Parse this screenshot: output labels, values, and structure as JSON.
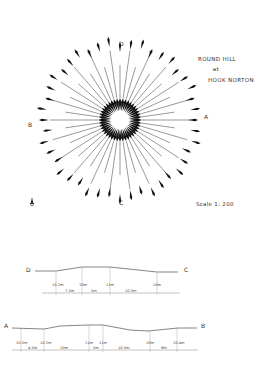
{
  "title": {
    "line1": "ROUND HILL",
    "line2": "at",
    "line3": "HOOK NORTON"
  },
  "plan": {
    "labels": {
      "A": "A",
      "B": "B",
      "C": "C",
      "D": "D"
    },
    "scale": "Scale 1: 200",
    "north_icon": "north-arrow-icon"
  },
  "section_dc": {
    "start_label": "D",
    "end_label": "C",
    "heights": [
      "10.2m",
      "10m",
      "11m",
      "10m"
    ],
    "distances": [
      "7.5m",
      "5m",
      "10.5m"
    ]
  },
  "section_ab": {
    "start_label": "A",
    "end_label": "B",
    "heights": [
      "10.5m",
      "10.2m",
      "11m",
      "11m",
      "10m",
      "10.4m"
    ],
    "distances": [
      "4.5m",
      "10m",
      "5m",
      "10.5m",
      "8m"
    ]
  }
}
